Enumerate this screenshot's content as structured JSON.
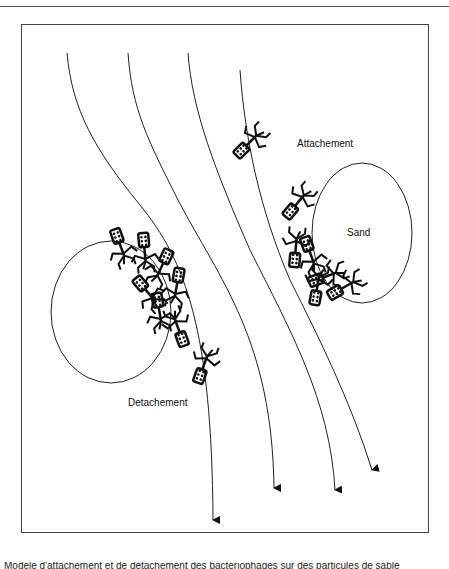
{
  "figure": {
    "labels": {
      "attachment": "Attachement",
      "sand": "Sand",
      "detachment": "Detachement"
    },
    "flow_lines_count": 4,
    "sand_grains_count": 2,
    "colors": {
      "line": "#222222",
      "frame": "#444444",
      "background": "#ffffff"
    }
  },
  "caption": {
    "text": "Modèle d'attachement et de détachement des bactériophages sur des particules de sable"
  }
}
